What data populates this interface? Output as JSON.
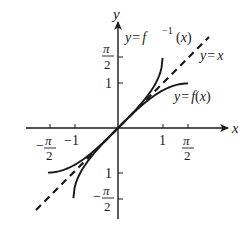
{
  "figure": {
    "type": "function-inverse-plot",
    "axes": {
      "x_label": "x",
      "y_label": "y"
    },
    "x_ticks": [
      {
        "value": -1.5708,
        "label_num": "π",
        "label_den": "2",
        "sign": "−"
      },
      {
        "value": -1,
        "label": "−1"
      },
      {
        "value": 1,
        "label": "1"
      },
      {
        "value": 1.5708,
        "label_num": "π",
        "label_den": "2",
        "sign": ""
      }
    ],
    "y_ticks": [
      {
        "value": 1.5708,
        "label_num": "π",
        "label_den": "2",
        "sign": ""
      },
      {
        "value": 1,
        "label": "1"
      },
      {
        "value": -1,
        "label": "1"
      },
      {
        "value": -1.5708,
        "label_num": "π",
        "label_den": "2",
        "sign": "−"
      }
    ],
    "curves": [
      {
        "name": "f",
        "label_prefix": "y = ",
        "label_fn": "f",
        "label_arg": "(x)",
        "function": "sin(x)",
        "domain": [
          -1.5708,
          1.5708
        ],
        "style": "solid"
      },
      {
        "name": "f_inverse",
        "label_prefix": "y = ",
        "label_fn": "f",
        "label_sup": "−1",
        "label_arg": "(x)",
        "function": "arcsin(x)",
        "domain": [
          -1,
          1
        ],
        "style": "solid"
      },
      {
        "name": "identity",
        "label": "y = x",
        "function": "x",
        "domain": [
          -1.85,
          2.05
        ],
        "style": "dashed"
      }
    ],
    "colors": {
      "ink": "#1a1a1a",
      "background": "#ffffff"
    }
  }
}
